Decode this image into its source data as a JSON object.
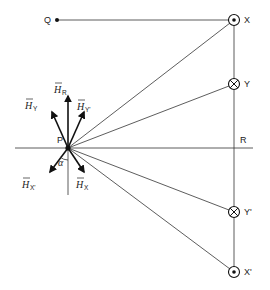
{
  "diagram": {
    "type": "magnetic field vectors from conductor pairs",
    "points": {
      "P": {
        "label": "P",
        "x": 68,
        "y": 148
      },
      "Q": {
        "label": "Q",
        "x": 57,
        "y": 20
      },
      "R": {
        "label": "R",
        "x": 234,
        "y": 148
      },
      "X": {
        "label": "X",
        "x": 234,
        "y": 20,
        "symbol": "dot",
        "meaning": "current out of page"
      },
      "Y": {
        "label": "Y",
        "x": 234,
        "y": 84,
        "symbol": "cross",
        "meaning": "current into page"
      },
      "Y_prime": {
        "label": "Y'",
        "x": 234,
        "y": 212,
        "symbol": "cross",
        "meaning": "current into page"
      },
      "X_prime": {
        "label": "X'",
        "x": 234,
        "y": 272,
        "symbol": "dot",
        "meaning": "current out of page"
      }
    },
    "vectors": [
      {
        "id": "H_R",
        "symbol": "H",
        "subscript": "R",
        "direction": "up"
      },
      {
        "id": "H_Y",
        "symbol": "H",
        "subscript": "Y",
        "direction": "up-left"
      },
      {
        "id": "H_Y_prime",
        "symbol": "H",
        "subscript": "Y'",
        "direction": "up-right"
      },
      {
        "id": "H_X_prime",
        "symbol": "H",
        "subscript": "X'",
        "direction": "down-left"
      },
      {
        "id": "H_X",
        "symbol": "H",
        "subscript": "X",
        "direction": "down-right"
      }
    ],
    "angle_label": "α",
    "labels": {
      "P": "P",
      "Q": "Q",
      "R": "R",
      "X": "X",
      "Y": "Y",
      "Y_prime": "Y'",
      "X_prime": "X'",
      "H": "H",
      "sub_R": "R",
      "sub_Y": "Y",
      "sub_Y_prime": "Y'",
      "sub_X_prime": "X'",
      "sub_X": "X",
      "alpha": "α"
    },
    "colors": {
      "line": "#333333",
      "background": "#ffffff"
    }
  }
}
